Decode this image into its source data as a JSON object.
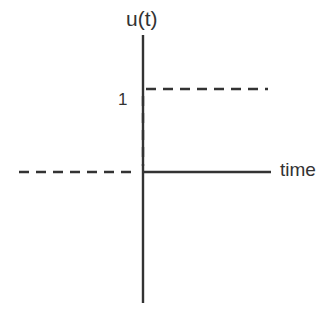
{
  "diagram": {
    "y_axis_label": "u(t)",
    "x_axis_label": "time",
    "level_label": "1",
    "colors": {
      "line": "#333333",
      "background": "#ffffff"
    },
    "elements": [
      {
        "type": "axis",
        "orientation": "vertical",
        "style": "solid"
      },
      {
        "type": "axis",
        "orientation": "horizontal",
        "style": "solid",
        "range": "t >= 0"
      },
      {
        "type": "line",
        "orientation": "horizontal",
        "style": "dashed",
        "range": "t < 0",
        "value": 0
      },
      {
        "type": "line",
        "orientation": "vertical",
        "style": "dashed",
        "at": "t = 0",
        "from": 0,
        "to": 1
      },
      {
        "type": "line",
        "orientation": "horizontal",
        "style": "dashed",
        "range": "t >= 0",
        "value": 1
      }
    ]
  }
}
